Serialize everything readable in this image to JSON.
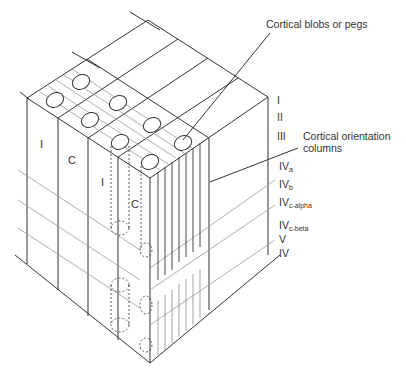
{
  "figure": {
    "callouts": {
      "blobs": "Cortical blobs or pegs",
      "orientation_line1": "Cortical orientation",
      "orientation_line2": "columns"
    },
    "layers": [
      {
        "main": "I",
        "sub": ""
      },
      {
        "main": "II",
        "sub": ""
      },
      {
        "main": "III",
        "sub": ""
      },
      {
        "main": "IV",
        "sub": "a"
      },
      {
        "main": "IV",
        "sub": "b"
      },
      {
        "main": "IV",
        "sub": "c-alpha"
      },
      {
        "main": "IV",
        "sub": "c-beta"
      },
      {
        "main": "V",
        "sub": ""
      },
      {
        "main": "IV",
        "sub": ""
      }
    ],
    "column_labels": {
      "left_I": "I",
      "left_C": "C",
      "mid_I": "I",
      "mid_C": "C"
    },
    "colors": {
      "line": "#333333",
      "faint_line": "#9a9a9a",
      "background": "#ffffff"
    }
  }
}
